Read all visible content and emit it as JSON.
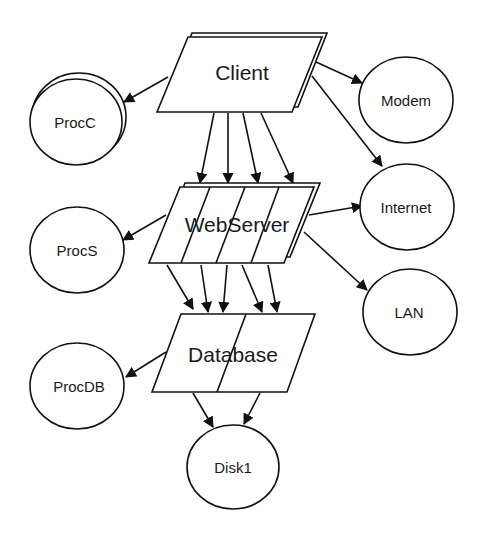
{
  "diagram": {
    "type": "architecture / queueing network",
    "nodes": {
      "client": {
        "label": "Client",
        "shape": "parallelogram-stacked"
      },
      "webserver": {
        "label": "WebServer",
        "shape": "parallelogram-stacked",
        "partitions": 4
      },
      "database": {
        "label": "Database",
        "shape": "parallelogram",
        "partitions": 2
      },
      "procc": {
        "label": "ProcC",
        "shape": "ellipse-stacked"
      },
      "modem": {
        "label": "Modem",
        "shape": "ellipse"
      },
      "internet": {
        "label": "Internet",
        "shape": "ellipse"
      },
      "procs": {
        "label": "ProcS",
        "shape": "ellipse"
      },
      "lan": {
        "label": "LAN",
        "shape": "ellipse"
      },
      "procdb": {
        "label": "ProcDB",
        "shape": "ellipse"
      },
      "disk1": {
        "label": "Disk1",
        "shape": "ellipse"
      }
    },
    "edges": [
      {
        "from": "Client",
        "to": "ProcC"
      },
      {
        "from": "Client",
        "to": "Modem"
      },
      {
        "from": "Client",
        "to": "Internet"
      },
      {
        "from": "Client",
        "to": "WebServer",
        "count": 4
      },
      {
        "from": "WebServer",
        "to": "ProcS"
      },
      {
        "from": "WebServer",
        "to": "Internet"
      },
      {
        "from": "WebServer",
        "to": "LAN"
      },
      {
        "from": "WebServer",
        "to": "Database",
        "count": 5
      },
      {
        "from": "Database",
        "to": "ProcDB"
      },
      {
        "from": "Database",
        "to": "Disk1",
        "count": 2
      }
    ],
    "colors": {
      "stroke": "#111111",
      "fill": "#ffffff",
      "text": "#1a1a1a"
    }
  }
}
